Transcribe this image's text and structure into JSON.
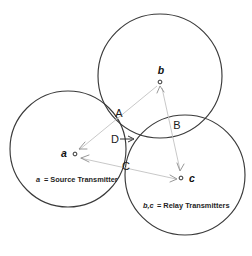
{
  "figure": {
    "clipped_top_caption": "",
    "background_color": "#ffffff",
    "circle_stroke_color": "#3a3a3a",
    "link_color": "#c2c2c2",
    "regions": [
      {
        "id": "A",
        "label": "A",
        "x": 119,
        "y": 113
      },
      {
        "id": "B",
        "label": "B",
        "x": 175,
        "y": 130
      },
      {
        "id": "C",
        "label": "C",
        "x": 125,
        "y": 165
      },
      {
        "id": "D",
        "label": "D",
        "x": 114,
        "y": 140
      }
    ],
    "nodes": [
      {
        "id": "a",
        "label": "a",
        "label_x": 66,
        "label_y": 156,
        "dot_x": 75,
        "dot_y": 154
      },
      {
        "id": "b",
        "label": "b",
        "label_x": 161,
        "label_y": 74,
        "dot_x": 160,
        "dot_y": 82
      },
      {
        "id": "c",
        "label": "c",
        "label_x": 191,
        "label_y": 181,
        "dot_x": 181,
        "dot_y": 178
      }
    ],
    "circles": [
      {
        "id": "circle-a",
        "cx": 68,
        "cy": 149,
        "r": 58
      },
      {
        "id": "circle-b",
        "cx": 160,
        "cy": 76,
        "r": 62
      },
      {
        "id": "circle-c",
        "cx": 185,
        "cy": 175,
        "r": 60
      }
    ],
    "legend": [
      {
        "id": "legend-source",
        "symbol": "a",
        "text": "= Source Transmitter",
        "x": 35,
        "y": 180
      },
      {
        "id": "legend-relay",
        "symbol": "b,c",
        "text": "= Relay Transmitters",
        "x": 143,
        "y": 206
      }
    ]
  }
}
